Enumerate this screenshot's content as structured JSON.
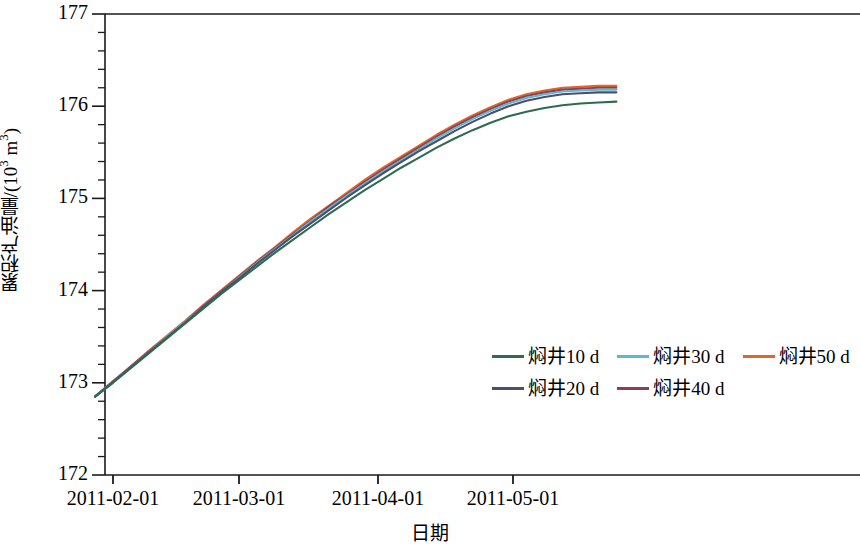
{
  "chart_data": {
    "type": "line",
    "title": "",
    "xlabel": "日期",
    "ylabel_main": "累积产油量/(10",
    "ylabel_sup": "3",
    "ylabel_tail": " m",
    "ylabel_sup2": "3",
    "ylabel_end": ")",
    "ylabel": "累积产油量/(10³ m³)",
    "ylim": [
      172,
      177
    ],
    "yticks": [
      172,
      173,
      174,
      175,
      176,
      177
    ],
    "ytick_labels": [
      "172",
      "173",
      "174",
      "175",
      "176",
      "177"
    ],
    "y_minor_per_major": 5,
    "xtick_labels": [
      "2011-02-01",
      "2011-03-01",
      "2011-04-01",
      "2011-05-01"
    ],
    "xtick_values": [
      "2011-02-01",
      "2011-03-01",
      "2011-04-01",
      "2011-05-01"
    ],
    "xlim": [
      "2011-01-28",
      "2011-05-26"
    ],
    "grid": false,
    "legend_position": "inside-lower-right",
    "x": [
      0,
      4,
      8,
      12,
      16,
      20,
      24,
      28,
      32,
      36,
      40,
      44,
      48,
      52,
      56,
      60,
      64,
      68,
      72,
      76,
      80,
      84,
      88,
      92,
      96,
      100,
      104,
      108,
      112,
      116
    ],
    "series": [
      {
        "name": "焖井10 d",
        "color": "#2e6b4f",
        "values": [
          172.85,
          173.0,
          173.16,
          173.32,
          173.48,
          173.64,
          173.8,
          173.96,
          174.11,
          174.26,
          174.41,
          174.55,
          174.69,
          174.83,
          174.96,
          175.09,
          175.21,
          175.33,
          175.44,
          175.55,
          175.65,
          175.74,
          175.82,
          175.89,
          175.94,
          175.98,
          176.01,
          176.03,
          176.04,
          176.05
        ]
      },
      {
        "name": "焖井20 d",
        "color": "#4a4f6e",
        "values": [
          172.85,
          173.01,
          173.17,
          173.33,
          173.49,
          173.65,
          173.82,
          173.98,
          174.13,
          174.29,
          174.44,
          174.59,
          174.73,
          174.87,
          175.01,
          175.14,
          175.27,
          175.39,
          175.51,
          175.62,
          175.73,
          175.83,
          175.92,
          176.0,
          176.06,
          176.1,
          176.13,
          176.14,
          176.15,
          176.15
        ]
      },
      {
        "name": "焖井30 d",
        "color": "#5fb8cc",
        "values": [
          172.85,
          173.01,
          173.17,
          173.33,
          173.5,
          173.66,
          173.82,
          173.98,
          174.14,
          174.3,
          174.45,
          174.6,
          174.75,
          174.89,
          175.03,
          175.16,
          175.29,
          175.41,
          175.53,
          175.65,
          175.76,
          175.86,
          175.95,
          176.03,
          176.09,
          176.13,
          176.16,
          176.17,
          176.18,
          176.18
        ]
      },
      {
        "name": "焖井40 d",
        "color": "#8c3f57",
        "values": [
          172.85,
          173.01,
          173.18,
          173.34,
          173.5,
          173.66,
          173.83,
          173.99,
          174.15,
          174.31,
          174.46,
          174.61,
          174.76,
          174.91,
          175.04,
          175.18,
          175.31,
          175.43,
          175.55,
          175.67,
          175.78,
          175.88,
          175.97,
          176.05,
          176.11,
          176.15,
          176.18,
          176.19,
          176.2,
          176.2
        ]
      },
      {
        "name": "焖井50 d",
        "color": "#e2662a",
        "values": [
          172.85,
          173.02,
          173.18,
          173.35,
          173.51,
          173.67,
          173.84,
          174.0,
          174.16,
          174.32,
          174.47,
          174.63,
          174.78,
          174.92,
          175.06,
          175.2,
          175.33,
          175.45,
          175.57,
          175.69,
          175.8,
          175.9,
          175.99,
          176.07,
          176.13,
          176.17,
          176.2,
          176.21,
          176.22,
          176.22
        ]
      }
    ]
  },
  "axes": {
    "frame_color": "#1a1a1a",
    "tick_color": "#1a1a1a"
  },
  "legend": {
    "rows": [
      [
        {
          "label": "焖井10 d",
          "color": "#2e6b4f"
        },
        {
          "label": "焖井30 d",
          "color": "#5fb8cc"
        },
        {
          "label": "焖井50 d",
          "color": "#e2662a"
        }
      ],
      [
        {
          "label": "焖井20 d",
          "color": "#4a4f6e"
        },
        {
          "label": "焖井40 d",
          "color": "#8c3f57"
        }
      ]
    ]
  }
}
